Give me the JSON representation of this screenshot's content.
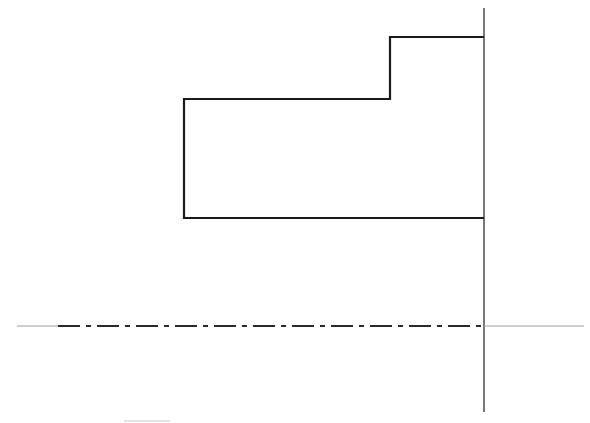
{
  "diagram": {
    "type": "technical-drawing",
    "colors": {
      "background": "#ffffff",
      "outline": "#1a1a1a",
      "axis": "#555555",
      "centerline": "#2a2a2a",
      "thin_line": "#9a9a9a"
    },
    "profile": {
      "points": [
        [
          484,
          37
        ],
        [
          390,
          37
        ],
        [
          390,
          99
        ],
        [
          184,
          99
        ],
        [
          184,
          218
        ],
        [
          484,
          218
        ]
      ],
      "stroke_width": 2.2
    },
    "vertical_axis": {
      "x": 484,
      "y1": 8,
      "y2": 412
    },
    "centerline": {
      "y": 326,
      "solid_left": {
        "x1": 17,
        "x2": 58
      },
      "dashdot": {
        "x1": 58,
        "x2": 484,
        "pattern": "22 6 5 6"
      },
      "solid_right": {
        "x1": 484,
        "x2": 584
      }
    },
    "small_mark": {
      "x1": 124,
      "x2": 170,
      "y": 421
    }
  }
}
